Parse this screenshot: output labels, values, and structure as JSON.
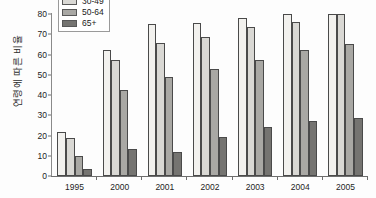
{
  "chart_data": {
    "type": "bar",
    "title": "",
    "subtitle": "",
    "xlabel": "",
    "ylabel": "연령에 따른 비율",
    "categories": [
      "1995",
      "2000",
      "2001",
      "2002",
      "2003",
      "2004",
      "2005"
    ],
    "series": [
      {
        "name": "18-29",
        "color": "#f2f1ee",
        "values": [
          21.5,
          62,
          75,
          75.5,
          78,
          80.5,
          80.5
        ]
      },
      {
        "name": "30-49",
        "color": "#d9d8d4",
        "values": [
          19,
          57.5,
          65.5,
          68.5,
          73.5,
          76,
          80
        ]
      },
      {
        "name": "50-64",
        "color": "#a9a8a4",
        "values": [
          10,
          42.5,
          49,
          53,
          57.5,
          62,
          65
        ]
      },
      {
        "name": "65+",
        "color": "#757471",
        "values": [
          3.5,
          13.5,
          12,
          19.5,
          24,
          27,
          28.5
        ]
      }
    ],
    "ylim": [
      0,
      80
    ],
    "yticks": [
      0,
      10,
      20,
      30,
      40,
      50,
      60,
      70,
      80
    ],
    "ytick_labels": [
      "0",
      "10",
      "20",
      "30",
      "40",
      "50",
      "60",
      "70",
      "80"
    ],
    "grid": false,
    "legend_position": "top-left",
    "legend_entries": [
      "30-49",
      "50-64",
      "65+"
    ]
  },
  "axis": {
    "y_label": "연령에 따른 비율",
    "y_ticks": [
      "80",
      "70",
      "60",
      "50",
      "40",
      "30",
      "20",
      "10",
      "0"
    ],
    "x_ticks": [
      "1995",
      "2000",
      "2001",
      "2002",
      "2003",
      "2004",
      "2005"
    ]
  },
  "legend": {
    "items": [
      {
        "label": "30-49",
        "swatch": "legend-swatch-light"
      },
      {
        "label": "50-64",
        "swatch": "legend-swatch-medium"
      },
      {
        "label": "65+",
        "swatch": "legend-swatch-dark"
      }
    ]
  }
}
